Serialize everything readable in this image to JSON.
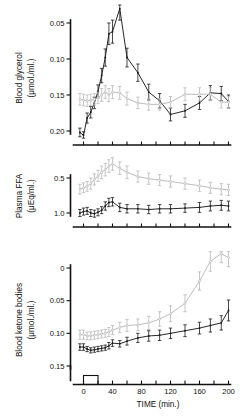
{
  "figure": {
    "caption_axis_x": "TIME (min.)"
  },
  "chart_data": [
    {
      "type": "line",
      "panel": "top",
      "title": "",
      "ylabel": "Blood glycerol (μmol./ml.)",
      "ylabel_line1": "Blood glycerol",
      "ylabel_line2": "(μmol./ml.)",
      "xlabel": "TIME (min.)",
      "ylim": [
        0.04,
        0.225
      ],
      "yticks": [
        0.05,
        0.1,
        0.15,
        0.2
      ],
      "ytick_labels": [
        "0.05",
        "0.10",
        "0.15",
        "0.20"
      ],
      "xlim": [
        -8,
        205
      ],
      "xticks": [
        0,
        40,
        80,
        120,
        160,
        200
      ],
      "xtick_labels": [
        "0",
        "40",
        "80",
        "120",
        "160",
        "200"
      ],
      "grid": false,
      "legend": "none",
      "series": [
        {
          "name": "exercise",
          "color": "#1b1b1b",
          "x": [
            -5,
            0,
            5,
            10,
            15,
            20,
            25,
            30,
            35,
            40,
            50,
            60,
            75,
            90,
            105,
            120,
            140,
            160,
            175,
            190,
            200
          ],
          "values": [
            0.048,
            0.044,
            0.068,
            0.076,
            0.089,
            0.105,
            0.127,
            0.152,
            0.185,
            0.188,
            0.22,
            0.152,
            0.131,
            0.104,
            0.092,
            0.073,
            0.078,
            0.089,
            0.103,
            0.102,
            0.091
          ],
          "errors": [
            0.006,
            0.005,
            0.007,
            0.008,
            0.008,
            0.009,
            0.01,
            0.012,
            0.015,
            0.016,
            0.016,
            0.013,
            0.012,
            0.011,
            0.01,
            0.009,
            0.009,
            0.009,
            0.01,
            0.01,
            0.009
          ]
        },
        {
          "name": "control",
          "color": "#b9b9b9",
          "x": [
            -5,
            0,
            5,
            10,
            15,
            20,
            25,
            30,
            35,
            40,
            50,
            60,
            75,
            90,
            105,
            120,
            140,
            160,
            175,
            190,
            200
          ],
          "values": [
            0.094,
            0.093,
            0.092,
            0.093,
            0.094,
            0.096,
            0.1,
            0.104,
            0.1,
            0.104,
            0.103,
            0.095,
            0.089,
            0.087,
            0.087,
            0.09,
            0.101,
            0.101,
            0.101,
            0.09,
            0.09
          ],
          "errors": [
            0.008,
            0.008,
            0.008,
            0.008,
            0.008,
            0.008,
            0.009,
            0.009,
            0.009,
            0.009,
            0.009,
            0.009,
            0.008,
            0.008,
            0.008,
            0.008,
            0.009,
            0.009,
            0.009,
            0.008,
            0.008
          ]
        }
      ]
    },
    {
      "type": "line",
      "panel": "middle",
      "title": "",
      "ylabel": "Plasma FFA (μEq/ml.)",
      "ylabel_line1": "Plasma FFA",
      "ylabel_line2": "(μEq/ml.)",
      "xlabel": "TIME (min.)",
      "ylim": [
        0.33,
        1.32
      ],
      "yticks": [
        0.5,
        1.0
      ],
      "ytick_labels": [
        "0.5",
        "1.0"
      ],
      "xlim": [
        -8,
        205
      ],
      "xticks": [
        0,
        40,
        80,
        120,
        160,
        200
      ],
      "xtick_labels": [
        "0",
        "40",
        "80",
        "120",
        "160",
        "200"
      ],
      "grid": false,
      "legend": "none",
      "series": [
        {
          "name": "exercise",
          "color": "#1b1b1b",
          "x": [
            -5,
            0,
            5,
            10,
            15,
            20,
            25,
            30,
            35,
            40,
            50,
            60,
            75,
            90,
            105,
            120,
            140,
            160,
            175,
            190,
            200
          ],
          "values": [
            0.5,
            0.52,
            0.53,
            0.5,
            0.49,
            0.51,
            0.54,
            0.6,
            0.65,
            0.66,
            0.58,
            0.56,
            0.56,
            0.55,
            0.56,
            0.56,
            0.57,
            0.58,
            0.6,
            0.61,
            0.6
          ],
          "errors": [
            0.05,
            0.05,
            0.05,
            0.05,
            0.05,
            0.05,
            0.05,
            0.06,
            0.06,
            0.06,
            0.06,
            0.06,
            0.06,
            0.06,
            0.06,
            0.06,
            0.06,
            0.07,
            0.07,
            0.07,
            0.07
          ]
        },
        {
          "name": "control",
          "color": "#b9b9b9",
          "x": [
            -5,
            0,
            5,
            10,
            15,
            20,
            25,
            30,
            35,
            40,
            50,
            60,
            75,
            90,
            105,
            120,
            140,
            160,
            175,
            190,
            200
          ],
          "values": [
            0.84,
            0.86,
            0.88,
            0.92,
            0.98,
            1.03,
            1.08,
            1.12,
            1.17,
            1.2,
            1.14,
            1.08,
            1.02,
            0.99,
            0.97,
            0.95,
            0.92,
            0.89,
            0.86,
            0.84,
            0.83
          ],
          "errors": [
            0.07,
            0.07,
            0.07,
            0.08,
            0.08,
            0.08,
            0.09,
            0.09,
            0.09,
            0.09,
            0.09,
            0.09,
            0.08,
            0.08,
            0.08,
            0.08,
            0.08,
            0.08,
            0.08,
            0.08,
            0.08
          ]
        }
      ]
    },
    {
      "type": "line",
      "panel": "bottom",
      "title": "",
      "ylabel": "Blood ketone bodies (μmol./ml.)",
      "ylabel_line1": "Blood ketone bodies",
      "ylabel_line2": "(μmol./ml.)",
      "xlabel": "TIME (min.)",
      "ylim": [
        0.0,
        0.175
      ],
      "yticks": [
        0,
        0.05,
        0.1,
        0.15
      ],
      "ytick_labels": [
        "0",
        "0.05",
        "0.10",
        "0.15"
      ],
      "xlim": [
        -8,
        205
      ],
      "xticks": [
        0,
        40,
        80,
        120,
        160,
        200
      ],
      "xtick_labels": [
        "0",
        "40",
        "80",
        "120",
        "160",
        "200"
      ],
      "grid": false,
      "legend": "none",
      "series": [
        {
          "name": "exercise",
          "color": "#1b1b1b",
          "x": [
            -5,
            0,
            5,
            10,
            15,
            20,
            25,
            30,
            35,
            40,
            50,
            60,
            75,
            90,
            105,
            120,
            140,
            160,
            175,
            190,
            200
          ],
          "values": [
            0.029,
            0.029,
            0.026,
            0.024,
            0.025,
            0.026,
            0.027,
            0.028,
            0.031,
            0.035,
            0.034,
            0.038,
            0.043,
            0.046,
            0.047,
            0.05,
            0.054,
            0.058,
            0.062,
            0.066,
            0.085
          ],
          "errors": [
            0.005,
            0.005,
            0.004,
            0.004,
            0.004,
            0.004,
            0.004,
            0.004,
            0.005,
            0.005,
            0.005,
            0.006,
            0.007,
            0.008,
            0.008,
            0.008,
            0.009,
            0.009,
            0.01,
            0.011,
            0.016
          ]
        },
        {
          "name": "control",
          "color": "#b9b9b9",
          "x": [
            -5,
            0,
            5,
            10,
            15,
            20,
            25,
            30,
            35,
            40,
            50,
            60,
            75,
            90,
            105,
            120,
            140,
            160,
            175,
            190,
            200
          ],
          "values": [
            0.048,
            0.048,
            0.046,
            0.046,
            0.047,
            0.048,
            0.049,
            0.05,
            0.052,
            0.055,
            0.059,
            0.062,
            0.063,
            0.066,
            0.072,
            0.08,
            0.096,
            0.13,
            0.16,
            0.172,
            0.166
          ],
          "errors": [
            0.007,
            0.007,
            0.006,
            0.006,
            0.006,
            0.006,
            0.006,
            0.006,
            0.007,
            0.007,
            0.008,
            0.009,
            0.009,
            0.01,
            0.011,
            0.012,
            0.013,
            0.014,
            0.015,
            0.014,
            0.014
          ]
        }
      ]
    }
  ],
  "period_marker": {
    "label": "",
    "start": 0,
    "end": 20
  }
}
